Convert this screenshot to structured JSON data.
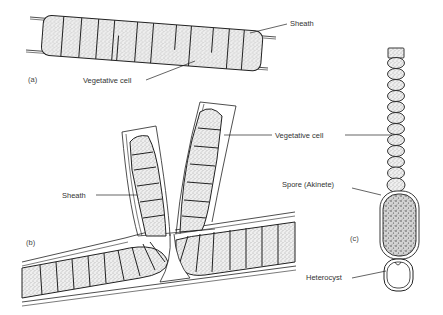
{
  "figure": {
    "panels": [
      {
        "id": "a",
        "label": "(a)",
        "annotations": [
          {
            "text": "Sheath",
            "target": "sheath"
          },
          {
            "text": "Vegetative cell",
            "target": "vegetative-cell"
          }
        ]
      },
      {
        "id": "b",
        "label": "(b)",
        "annotations": [
          {
            "text": "Sheath",
            "target": "sheath"
          },
          {
            "text": "Vegetative cell",
            "target": "vegetative-cell"
          }
        ]
      },
      {
        "id": "c",
        "label": "(c)",
        "annotations": [
          {
            "text": "Spore (Akinete)",
            "target": "akinete"
          },
          {
            "text": "Heterocyst",
            "target": "heterocyst"
          }
        ]
      }
    ]
  },
  "colors": {
    "ink": "#222222",
    "cell_fill": "#e6e6e6",
    "spore_fill": "#bdbdbd",
    "background": "#ffffff"
  }
}
